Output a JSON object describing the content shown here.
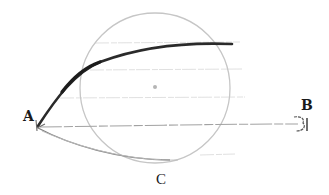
{
  "diagram": {
    "labels": {
      "a": "A",
      "b": "B",
      "c": "C"
    },
    "colors": {
      "background": "#ffffff",
      "circle": "#c8c8c8",
      "guide_lines": "#dadada",
      "thick_curve": "#2e2e2e",
      "lower_curve": "#8a8a8a",
      "line_ab": "#9a9a9a",
      "label": "#1a1a1a"
    },
    "shapes": {
      "circle": {
        "cx": 155,
        "cy": 88,
        "r": 75
      },
      "center_dot": {
        "cx": 155,
        "cy": 87,
        "r": 2
      },
      "guide_lines_y": [
        43,
        70,
        98
      ],
      "point_a": {
        "x": 37,
        "y": 128
      },
      "point_b": {
        "x": 302,
        "y": 125
      },
      "point_c": {
        "x": 168,
        "y": 162
      }
    }
  }
}
